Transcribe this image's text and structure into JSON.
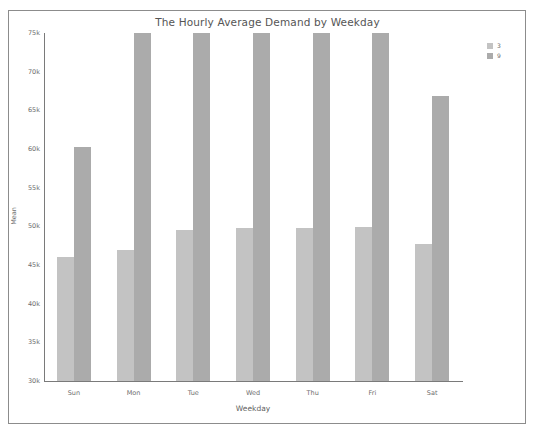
{
  "chart_data": {
    "type": "bar",
    "title": "The Hourly Average Demand by Weekday",
    "xlabel": "Weekday",
    "ylabel": "Mean",
    "categories": [
      "Sun",
      "Mon",
      "Tue",
      "Wed",
      "Thu",
      "Fri",
      "Sat"
    ],
    "series": [
      {
        "name": "3",
        "color": "#c3c3c3",
        "values": [
          46100,
          46900,
          49500,
          49800,
          49800,
          49900,
          47700
        ]
      },
      {
        "name": "9",
        "color": "#ababab",
        "values": [
          60300,
          75000,
          75000,
          75000,
          75000,
          75000,
          66800
        ]
      }
    ],
    "ylim": [
      30000,
      75000
    ],
    "yticks": [
      30000,
      35000,
      40000,
      45000,
      50000,
      55000,
      60000,
      65000,
      70000,
      75000
    ],
    "ytick_labels": [
      "30k",
      "35k",
      "40k",
      "45k",
      "50k",
      "55k",
      "60k",
      "65k",
      "70k",
      "75k"
    ],
    "grid": false,
    "legend_position": "top-right",
    "note_bars_clipped_at_top": true
  }
}
